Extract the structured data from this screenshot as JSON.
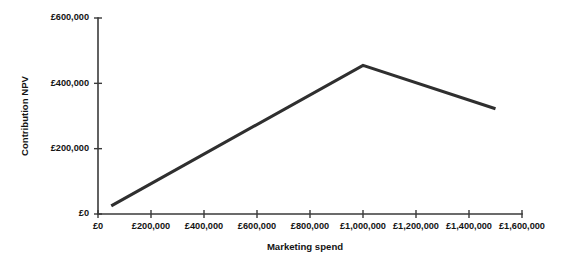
{
  "chart_data": {
    "type": "line",
    "title": "",
    "subtitle": "",
    "xlabel": "Marketing spend",
    "ylabel": "Contribution NPV",
    "xlim": [
      0,
      1600000
    ],
    "ylim": [
      0,
      600000
    ],
    "grid": false,
    "legend": null,
    "legend_position": "none",
    "line_color": "#2f2f2f",
    "axis_color": "#3a3a3a",
    "x_tick_labels": [
      "£0",
      "£200,000",
      "£400,000",
      "£600,000",
      "£800,000",
      "£1,000,000",
      "£1,200,000",
      "£1,400,000",
      "£1,600,000"
    ],
    "x_tick_values": [
      0,
      200000,
      400000,
      600000,
      800000,
      1000000,
      1200000,
      1400000,
      1600000
    ],
    "y_tick_labels": [
      "£0",
      "£200,000",
      "£400,000",
      "£600,000"
    ],
    "y_tick_values": [
      0,
      200000,
      400000,
      600000
    ],
    "series": [
      {
        "name": "Contribution NPV",
        "x": [
          50000,
          1000000,
          1500000
        ],
        "y": [
          25000,
          455000,
          322000
        ]
      }
    ],
    "annotations": []
  }
}
